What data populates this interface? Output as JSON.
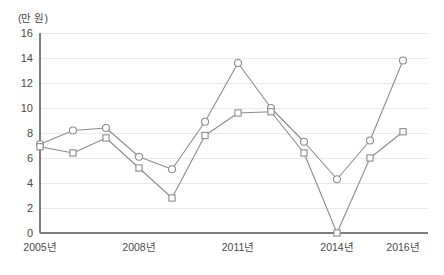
{
  "chart_data": {
    "type": "line",
    "title": "",
    "subtitle": "",
    "xlabel": "",
    "ylabel": "(만 원)",
    "unit_label": "(만 원)",
    "x": [
      2005,
      2006,
      2007,
      2008,
      2009,
      2010,
      2011,
      2012,
      2013,
      2014,
      2015,
      2016
    ],
    "categories": [
      "2005년",
      "2006년",
      "2007년",
      "2008년",
      "2009년",
      "2010년",
      "2011년",
      "2012년",
      "2013년",
      "2014년",
      "2015년",
      "2016년"
    ],
    "tick_labels_x": [
      "2005년",
      "2008년",
      "2011년",
      "2014년",
      "2016년"
    ],
    "tick_positions_x": [
      2005,
      2008,
      2011,
      2014,
      2016
    ],
    "tick_labels_y": [
      "0",
      "2",
      "4",
      "6",
      "8",
      "10",
      "12",
      "14",
      "16"
    ],
    "ylim": [
      0,
      16
    ],
    "xlim": [
      2005,
      2016
    ],
    "ystep": 2,
    "grid": true,
    "grid_axis": "y",
    "legend": false,
    "legend_position": "none",
    "series": [
      {
        "name": "series-circle",
        "marker": "circle",
        "color": "#8c8c8c",
        "values": [
          7.1,
          8.2,
          8.4,
          6.1,
          5.1,
          8.9,
          13.6,
          10.0,
          7.3,
          4.3,
          7.4,
          13.8
        ]
      },
      {
        "name": "series-square",
        "marker": "square",
        "color": "#8c8c8c",
        "values": [
          6.9,
          6.4,
          7.6,
          5.2,
          2.8,
          7.8,
          9.6,
          9.7,
          6.4,
          0.0,
          6.0,
          8.1
        ]
      }
    ]
  },
  "colors": {
    "line": "#8c8c8c",
    "axis": "#7d7d7d",
    "grid": "#e9e9e9",
    "text": "#4a4a4a",
    "marker_fill": "#ffffff",
    "background": "#ffffff"
  }
}
